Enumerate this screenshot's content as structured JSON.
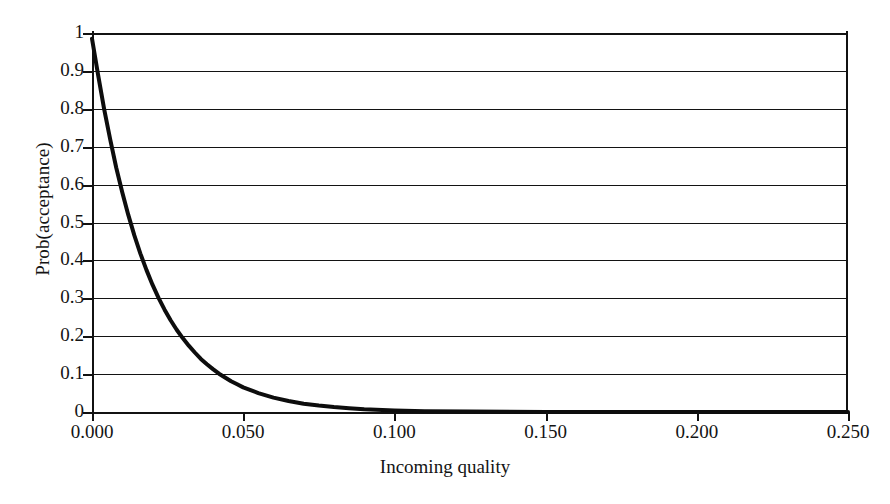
{
  "chart_data": {
    "type": "line",
    "title": "",
    "xlabel": "Incoming quality",
    "ylabel": "Prob(acceptance)",
    "xlim": [
      0.0,
      0.25
    ],
    "ylim": [
      0.0,
      1.0
    ],
    "grid": true,
    "legend": null,
    "xticks": [
      "0.000",
      "0.050",
      "0.100",
      "0.150",
      "0.200",
      "0.250"
    ],
    "xtick_values": [
      0.0,
      0.05,
      0.1,
      0.15,
      0.2,
      0.25
    ],
    "yticks": [
      "0",
      "0.1",
      "0.2",
      "0.3",
      "0.4",
      "0.5",
      "0.6",
      "0.7",
      "0.8",
      "0.9",
      "1"
    ],
    "ytick_values": [
      0,
      0.1,
      0.2,
      0.3,
      0.4,
      0.5,
      0.6,
      0.7,
      0.8,
      0.9,
      1
    ],
    "series": [
      {
        "name": "Operating characteristic curve",
        "color": "#0d0d0d",
        "linewidth": 4,
        "x": [
          0.0,
          0.002,
          0.004,
          0.006,
          0.008,
          0.01,
          0.012,
          0.014,
          0.016,
          0.018,
          0.02,
          0.022,
          0.024,
          0.026,
          0.028,
          0.03,
          0.032,
          0.034,
          0.036,
          0.038,
          0.04,
          0.042,
          0.044,
          0.046,
          0.048,
          0.05,
          0.055,
          0.06,
          0.065,
          0.07,
          0.075,
          0.08,
          0.085,
          0.09,
          0.1,
          0.11,
          0.125,
          0.15,
          0.175,
          0.2,
          0.225,
          0.25
        ],
        "y": [
          0.985,
          0.89,
          0.8,
          0.72,
          0.645,
          0.58,
          0.52,
          0.466,
          0.418,
          0.375,
          0.336,
          0.301,
          0.27,
          0.242,
          0.217,
          0.195,
          0.175,
          0.157,
          0.14,
          0.126,
          0.113,
          0.101,
          0.091,
          0.081,
          0.073,
          0.065,
          0.05,
          0.038,
          0.029,
          0.022,
          0.017,
          0.013,
          0.01,
          0.007,
          0.004,
          0.002,
          0.001,
          0.0,
          0.0,
          0.0,
          0.0,
          0.0
        ]
      }
    ]
  },
  "axes": {
    "x_title": "Incoming quality",
    "y_title": "Prob(acceptance)"
  },
  "colors": {
    "curve": "#0d0d0d",
    "grid": "#131313",
    "axis": "#111111",
    "background": "#ffffff",
    "text": "#141414"
  }
}
